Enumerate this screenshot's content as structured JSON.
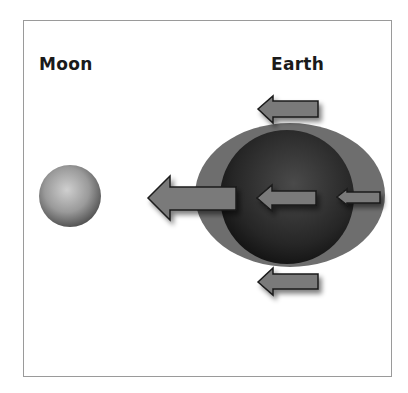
{
  "diagram": {
    "labels": {
      "moon": "Moon",
      "earth": "Earth"
    },
    "colors": {
      "frame_border": "#9a9a9a",
      "tidal_bulge": "#6e6e6e",
      "earth": "#2b2b2b",
      "moon": "#9a9a9a",
      "arrow_fill": "#7a7a7a",
      "arrow_stroke": "#1a1a1a"
    },
    "objects": [
      {
        "name": "moon",
        "shape": "circle",
        "cx": 70,
        "cy": 196,
        "r": 31
      },
      {
        "name": "tidal-bulge",
        "shape": "ellipse",
        "cx": 290,
        "cy": 195,
        "rx": 95,
        "ry": 72
      },
      {
        "name": "earth",
        "shape": "circle",
        "cx": 287,
        "cy": 197,
        "r": 67
      }
    ],
    "arrows": [
      {
        "name": "top-arrow",
        "direction": "left",
        "tip": [
          258,
          109
        ]
      },
      {
        "name": "large-arrow-toward-moon",
        "direction": "left",
        "tip": [
          148,
          198
        ]
      },
      {
        "name": "center-arrow",
        "direction": "left",
        "tip": [
          257,
          198
        ]
      },
      {
        "name": "far-side-arrow",
        "direction": "left",
        "tip": [
          337,
          197
        ]
      },
      {
        "name": "bottom-arrow",
        "direction": "left",
        "tip": [
          258,
          282
        ]
      }
    ]
  }
}
